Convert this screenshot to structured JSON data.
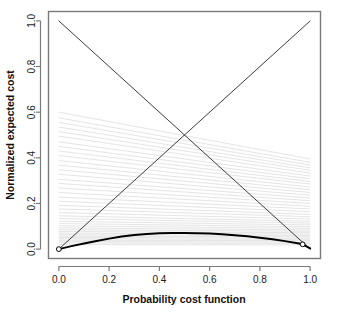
{
  "chart_data": {
    "type": "line",
    "title": "",
    "xlabel": "Probability cost function",
    "ylabel": "Normalized expected cost",
    "xlim": [
      0,
      1
    ],
    "ylim": [
      0,
      1
    ],
    "grid": false,
    "legend_position": "none",
    "xticks": [
      "0.0",
      "0.2",
      "0.4",
      "0.6",
      "0.8",
      "1.0"
    ],
    "xtick_values": [
      0.0,
      0.2,
      0.4,
      0.6,
      0.8,
      1.0
    ],
    "yticks": [
      "0.0",
      "0.2",
      "0.4",
      "0.6",
      "0.8",
      "1.0"
    ],
    "ytick_values": [
      0.0,
      0.2,
      0.4,
      0.6,
      0.8,
      1.0
    ],
    "colors": {
      "diagonal": "#3c3c3c",
      "cost_lines": "#d8d8d8",
      "envelope": "#000000",
      "axis": "#7a7a7a",
      "text": "#1a1a1a"
    },
    "series": [
      {
        "name": "always-negative diagonal",
        "style": "solid",
        "width": 1,
        "color": "#3c3c3c",
        "x": [
          0.0,
          1.0
        ],
        "values": [
          1.0,
          0.0
        ]
      },
      {
        "name": "always-positive diagonal",
        "style": "solid",
        "width": 1,
        "color": "#3c3c3c",
        "x": [
          0.0,
          1.0
        ],
        "values": [
          0.0,
          1.0
        ]
      },
      {
        "name": "cost curve lower envelope",
        "style": "solid",
        "width": 2,
        "color": "#000000",
        "x": [
          0.0,
          0.05,
          0.1,
          0.15,
          0.2,
          0.25,
          0.3,
          0.35,
          0.4,
          0.45,
          0.5,
          0.55,
          0.6,
          0.65,
          0.7,
          0.75,
          0.8,
          0.85,
          0.9,
          0.95,
          0.97,
          1.0
        ],
        "values": [
          0.0,
          0.013,
          0.025,
          0.036,
          0.046,
          0.055,
          0.062,
          0.066,
          0.069,
          0.071,
          0.071,
          0.07,
          0.068,
          0.065,
          0.061,
          0.056,
          0.05,
          0.043,
          0.035,
          0.026,
          0.021,
          0.003
        ]
      }
    ],
    "cost_lines": {
      "name": "individual classifier cost lines",
      "count": 40,
      "color": "#d8d8d8",
      "width": 0.7,
      "note": "straight lines from (0, y0) to (1, y1)",
      "endpoints": [
        [
          0.6,
          0.395
        ],
        [
          0.575,
          0.38
        ],
        [
          0.555,
          0.368
        ],
        [
          0.535,
          0.356
        ],
        [
          0.515,
          0.345
        ],
        [
          0.495,
          0.333
        ],
        [
          0.47,
          0.32
        ],
        [
          0.45,
          0.308
        ],
        [
          0.43,
          0.296
        ],
        [
          0.41,
          0.285
        ],
        [
          0.388,
          0.272
        ],
        [
          0.368,
          0.26
        ],
        [
          0.348,
          0.248
        ],
        [
          0.328,
          0.236
        ],
        [
          0.306,
          0.224
        ],
        [
          0.288,
          0.212
        ],
        [
          0.268,
          0.2
        ],
        [
          0.248,
          0.188
        ],
        [
          0.228,
          0.176
        ],
        [
          0.21,
          0.164
        ],
        [
          0.192,
          0.152
        ],
        [
          0.176,
          0.142
        ],
        [
          0.16,
          0.132
        ],
        [
          0.146,
          0.122
        ],
        [
          0.134,
          0.114
        ],
        [
          0.122,
          0.106
        ],
        [
          0.112,
          0.098
        ],
        [
          0.102,
          0.091
        ],
        [
          0.093,
          0.084
        ],
        [
          0.085,
          0.078
        ],
        [
          0.077,
          0.072
        ],
        [
          0.07,
          0.066
        ],
        [
          0.063,
          0.06
        ],
        [
          0.057,
          0.054
        ],
        [
          0.051,
          0.048
        ],
        [
          0.045,
          0.043
        ],
        [
          0.039,
          0.037
        ],
        [
          0.033,
          0.031
        ],
        [
          0.027,
          0.025
        ],
        [
          0.02,
          0.018
        ]
      ]
    },
    "markers": [
      {
        "name": "origin-marker",
        "x": 0.0,
        "y": 0.0,
        "shape": "circle",
        "filled": false
      },
      {
        "name": "right-end-marker",
        "x": 0.97,
        "y": 0.021,
        "shape": "circle",
        "filled": false
      }
    ]
  }
}
